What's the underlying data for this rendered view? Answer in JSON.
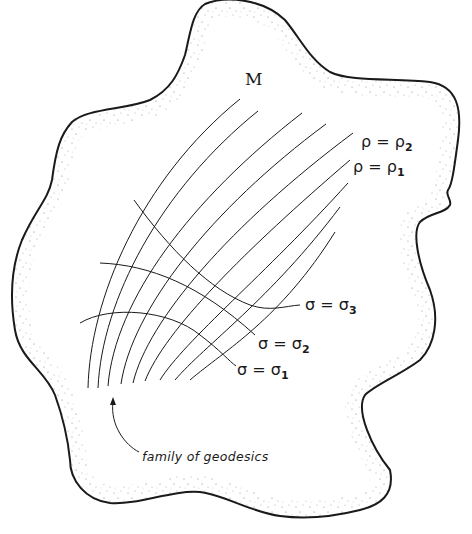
{
  "diagram": {
    "manifold_label": "M",
    "rho_labels": [
      {
        "lhs": "ρ",
        "eq": "=",
        "rhs": "ρ",
        "sub": "2"
      },
      {
        "lhs": "ρ",
        "eq": "=",
        "rhs": "ρ",
        "sub": "1"
      }
    ],
    "sigma_labels": [
      {
        "lhs": "σ",
        "eq": "=",
        "rhs": "σ",
        "sub": "3"
      },
      {
        "lhs": "σ",
        "eq": "=",
        "rhs": "σ",
        "sub": "2"
      },
      {
        "lhs": "σ",
        "eq": "=",
        "rhs": "σ",
        "sub": "1"
      }
    ],
    "caption": "family of geodesics",
    "colors": {
      "stroke": "#1a1a1a",
      "stipple": "#8a8a8a",
      "background": "#ffffff"
    }
  }
}
